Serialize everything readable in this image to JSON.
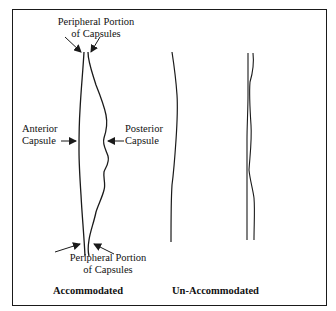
{
  "figure": {
    "type": "diagram",
    "colors": {
      "line": "#1a1a1a",
      "background": "#ffffff",
      "text": "#111111"
    },
    "accommodated": {
      "caption": "Accommodated",
      "labels": {
        "top_peripheral_line1": "Peripheral Portion",
        "top_peripheral_line2": "of Capsules",
        "anterior_line1": "Anterior",
        "anterior_line2": "Capsule",
        "posterior_line1": "Posterior",
        "posterior_line2": "Capsule",
        "bottom_peripheral_line1": "Peripheral Portion",
        "bottom_peripheral_line2": "of Capsules"
      }
    },
    "unaccommodated": {
      "caption": "Un-Accommodated"
    }
  }
}
